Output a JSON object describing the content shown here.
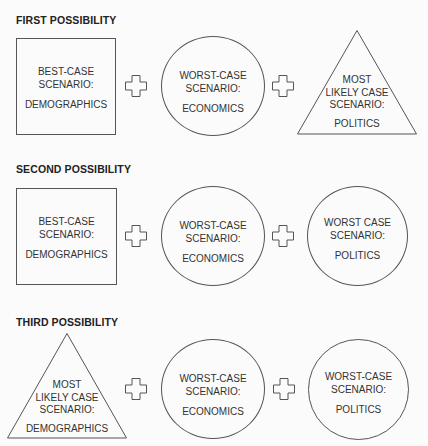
{
  "sections": [
    {
      "title": "FIRST POSSIBILITY",
      "items": [
        {
          "shape": "square",
          "line1": "BEST-CASE",
          "line2": "SCENARIO:",
          "line3": "",
          "subject": "DEMOGRAPHICS"
        },
        {
          "shape": "circle",
          "line1": "WORST-CASE",
          "line2": "SCENARIO:",
          "line3": "",
          "subject": "ECONOMICS"
        },
        {
          "shape": "triangle",
          "line1": "MOST",
          "line2": "LIKELY CASE",
          "line3": "SCENARIO:",
          "subject": "POLITICS"
        }
      ]
    },
    {
      "title": "SECOND POSSIBILITY",
      "items": [
        {
          "shape": "square",
          "line1": "BEST-CASE",
          "line2": "SCENARIO:",
          "line3": "",
          "subject": "DEMOGRAPHICS"
        },
        {
          "shape": "circle",
          "line1": "WORST-CASE",
          "line2": "SCENARIO:",
          "line3": "",
          "subject": "ECONOMICS"
        },
        {
          "shape": "circle",
          "line1": "WORST CASE",
          "line2": "SCENARIO:",
          "line3": "",
          "subject": "POLITICS"
        }
      ]
    },
    {
      "title": "THIRD POSSIBILITY",
      "items": [
        {
          "shape": "triangle",
          "line1": "MOST",
          "line2": "LIKELY CASE",
          "line3": "SCENARIO:",
          "subject": "DEMOGRAPHICS"
        },
        {
          "shape": "circle",
          "line1": "WORST-CASE",
          "line2": "SCENARIO:",
          "line3": "",
          "subject": "ECONOMICS"
        },
        {
          "shape": "circle",
          "line1": "WORST-CASE",
          "line2": "SCENARIO:",
          "line3": "",
          "subject": "POLITICS"
        }
      ]
    }
  ],
  "connector_icon": "plus-outline-icon",
  "colors": {
    "stroke": "#555555",
    "text": "#333333",
    "background": "#fbfbfb"
  }
}
